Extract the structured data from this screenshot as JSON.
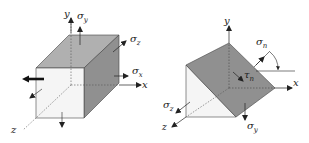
{
  "figure": {
    "left": {
      "title": "stress cube",
      "axes": {
        "x": "x",
        "y": "y",
        "z": "z"
      },
      "stresses": {
        "sigma_y": {
          "symbol": "σ",
          "sub": "y"
        },
        "sigma_z": {
          "symbol": "σ",
          "sub": "z"
        },
        "sigma_x": {
          "symbol": "σ",
          "sub": "x"
        }
      }
    },
    "right": {
      "title": "stress wedge",
      "axes": {
        "x": "x",
        "y": "y",
        "z": "z"
      },
      "stresses": {
        "sigma_n": {
          "symbol": "σ",
          "sub": "n"
        },
        "tau_n": {
          "symbol": "τ",
          "sub": "n"
        },
        "sigma_z": {
          "symbol": "σ",
          "sub": "z"
        },
        "sigma_y": {
          "symbol": "σ",
          "sub": "y"
        }
      }
    },
    "colors": {
      "front_face": "#f4f4f4",
      "top_face": "#a9a9a9",
      "side_face": "#8c8c8c",
      "wedge_face": "#8f8f8f",
      "line": "#222222"
    }
  }
}
